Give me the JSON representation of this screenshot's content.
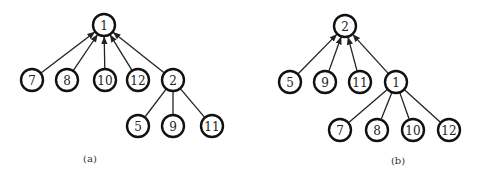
{
  "panels": [
    {
      "id": "a",
      "caption": "(a)",
      "caption_pos": [
        90,
        162
      ],
      "root": "1",
      "nodes": [
        {
          "label": "1",
          "x": 104,
          "y": 25
        },
        {
          "label": "7",
          "x": 32,
          "y": 80
        },
        {
          "label": "8",
          "x": 67,
          "y": 80
        },
        {
          "label": "10",
          "x": 105,
          "y": 80
        },
        {
          "label": "12",
          "x": 138,
          "y": 80
        },
        {
          "label": "2",
          "x": 173,
          "y": 80
        },
        {
          "label": "5",
          "x": 138,
          "y": 126
        },
        {
          "label": "9",
          "x": 173,
          "y": 126
        },
        {
          "label": "11",
          "x": 212,
          "y": 126
        }
      ],
      "edges": [
        {
          "from": "7",
          "to": "1",
          "arrow": true
        },
        {
          "from": "8",
          "to": "1",
          "arrow": true
        },
        {
          "from": "10",
          "to": "1",
          "arrow": true
        },
        {
          "from": "12",
          "to": "1",
          "arrow": true
        },
        {
          "from": "2",
          "to": "1",
          "arrow": true
        },
        {
          "from": "2",
          "to": "5",
          "arrow": false
        },
        {
          "from": "2",
          "to": "9",
          "arrow": false
        },
        {
          "from": "2",
          "to": "11",
          "arrow": false
        }
      ]
    },
    {
      "id": "b",
      "caption": "(b)",
      "caption_pos": [
        398,
        164
      ],
      "root": "2",
      "nodes": [
        {
          "label": "2",
          "x": 345,
          "y": 26
        },
        {
          "label": "5",
          "x": 290,
          "y": 82
        },
        {
          "label": "9",
          "x": 325,
          "y": 82
        },
        {
          "label": "11",
          "x": 360,
          "y": 82
        },
        {
          "label": "1",
          "x": 396,
          "y": 82
        },
        {
          "label": "7",
          "x": 340,
          "y": 130
        },
        {
          "label": "8",
          "x": 377,
          "y": 130
        },
        {
          "label": "10",
          "x": 413,
          "y": 130
        },
        {
          "label": "12",
          "x": 449,
          "y": 130
        }
      ],
      "edges": [
        {
          "from": "5",
          "to": "2",
          "arrow": true
        },
        {
          "from": "9",
          "to": "2",
          "arrow": true
        },
        {
          "from": "11",
          "to": "2",
          "arrow": true
        },
        {
          "from": "1",
          "to": "2",
          "arrow": true
        },
        {
          "from": "1",
          "to": "7",
          "arrow": false
        },
        {
          "from": "1",
          "to": "8",
          "arrow": false
        },
        {
          "from": "1",
          "to": "10",
          "arrow": false
        },
        {
          "from": "1",
          "to": "12",
          "arrow": false
        }
      ]
    }
  ],
  "style": {
    "node_radius": 11,
    "stroke_color": "#111111",
    "edge_color": "#222222",
    "background": "#ffffff"
  }
}
